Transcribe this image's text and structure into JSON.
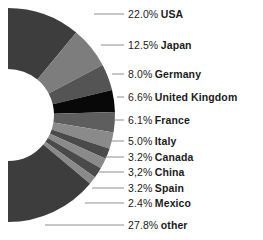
{
  "chart_data": {
    "type": "pie",
    "variant": "donut",
    "title": "",
    "subtitle": "",
    "xlabel": "",
    "ylabel": "",
    "grid": false,
    "legend_position": "none",
    "label_format": "{percent} {category}",
    "units": "percent",
    "total": 100.0,
    "categories": [
      "USA",
      "Japan",
      "Germany",
      "United Kingdom",
      "France",
      "Italy",
      "Canada",
      "China",
      "Spain",
      "Mexico",
      "other"
    ],
    "values": [
      22.0,
      12.5,
      8.0,
      6.6,
      6.1,
      5.0,
      3.2,
      3.2,
      3.2,
      2.4,
      27.8
    ],
    "slice_colors": [
      "#3d3d3d",
      "#7d7d7d",
      "#545454",
      "#080808",
      "#5e5e5e",
      "#8a8a8a",
      "#4a4a4a",
      "#8a8a8a",
      "#4a4a4a",
      "#8a8a8a",
      "#3d3d3d"
    ],
    "slices": [
      {
        "category": "USA",
        "value": 22.0,
        "percent_text": "22.0%",
        "color": "#3d3d3d",
        "label": "22.0% USA"
      },
      {
        "category": "Japan",
        "value": 12.5,
        "percent_text": "12.5%",
        "color": "#7d7d7d",
        "label": "12.5% Japan"
      },
      {
        "category": "Germany",
        "value": 8.0,
        "percent_text": "8.0%",
        "color": "#545454",
        "label": "8.0% Germany"
      },
      {
        "category": "United Kingdom",
        "value": 6.6,
        "percent_text": "6.6%",
        "color": "#080808",
        "label": "6.6% United Kingdom"
      },
      {
        "category": "France",
        "value": 6.1,
        "percent_text": "6.1%",
        "color": "#5e5e5e",
        "label": "6.1% France"
      },
      {
        "category": "Italy",
        "value": 5.0,
        "percent_text": "5.0%",
        "color": "#8a8a8a",
        "label": "5.0% Italy"
      },
      {
        "category": "Canada",
        "value": 3.2,
        "percent_text": "3.2%",
        "color": "#4a4a4a",
        "label": "3.2% Canada"
      },
      {
        "category": "China",
        "value": 3.2,
        "percent_text": "3,2%",
        "color": "#8a8a8a",
        "label": "3,2% China"
      },
      {
        "category": "Spain",
        "value": 3.2,
        "percent_text": "3.2%",
        "color": "#4a4a4a",
        "label": "3.2% Spain"
      },
      {
        "category": "Mexico",
        "value": 2.4,
        "percent_text": "2.4%",
        "color": "#8a8a8a",
        "label": "2.4% Mexico"
      },
      {
        "category": "other",
        "value": 27.8,
        "percent_text": "27.8%",
        "color": "#3d3d3d",
        "label": "27.8% other"
      }
    ]
  },
  "labels": [
    {
      "pct": "22.0%",
      "name": "USA",
      "x": 128,
      "y": 14,
      "leader_x1": 94,
      "leader_x2": 124
    },
    {
      "pct": "12.5%",
      "name": "Japan",
      "x": 128,
      "y": 45,
      "leader_x1": 101,
      "leader_x2": 124
    },
    {
      "pct": "8.0%",
      "name": "Germany",
      "x": 128,
      "y": 74,
      "leader_x1": 112,
      "leader_x2": 124
    },
    {
      "pct": "6.6%",
      "name": "United Kingdom",
      "x": 128,
      "y": 97,
      "leader_x1": 117,
      "leader_x2": 124
    },
    {
      "pct": "6.1%",
      "name": "France",
      "x": 128,
      "y": 120,
      "leader_x1": 115,
      "leader_x2": 124
    },
    {
      "pct": "5.0%",
      "name": "Italy",
      "x": 128,
      "y": 141,
      "leader_x1": 110,
      "leader_x2": 124
    },
    {
      "pct": "3.2%",
      "name": "Canada",
      "x": 128,
      "y": 157,
      "leader_x1": 105,
      "leader_x2": 124
    },
    {
      "pct": "3,2%",
      "name": "China",
      "x": 128,
      "y": 172,
      "leader_x1": 99,
      "leader_x2": 124
    },
    {
      "pct": "3.2%",
      "name": "Spain",
      "x": 128,
      "y": 188,
      "leader_x1": 92,
      "leader_x2": 124
    },
    {
      "pct": "2.4%",
      "name": "Mexico",
      "x": 128,
      "y": 203,
      "leader_x1": 85,
      "leader_x2": 124
    },
    {
      "pct": "27.8%",
      "name": "other",
      "x": 128,
      "y": 225,
      "leader_x1": 45,
      "leader_x2": 124
    }
  ],
  "style": {
    "background": "#ffffff",
    "text_color": "#1b1b1b",
    "leader_color": "#8e8e8e",
    "hole_color": "#ffffff",
    "center_x": 8,
    "center_y": 115,
    "outer_radius": 107,
    "inner_radius": 46
  }
}
